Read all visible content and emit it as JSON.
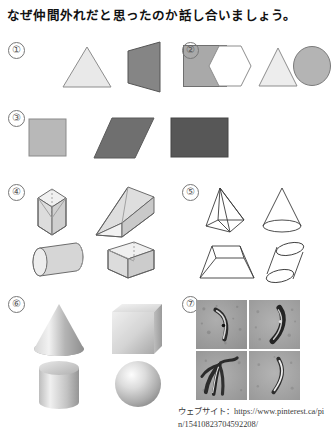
{
  "worksheet": {
    "title": "なぜ仲間外れだと思ったのか話し合いましょう。",
    "source_label": "ウェブサイト：https://www.pinterest.ca/pin/15410823704592208/"
  },
  "groups": [
    {
      "id": "group-1",
      "marker": "①",
      "style": "flat-filled-2d",
      "shapes": [
        {
          "name": "triangle",
          "fill": "#e9e9e9",
          "stroke": "#8d8d8d"
        },
        {
          "name": "perspective-quadrilateral",
          "fill": "#858585",
          "stroke": "#555555"
        },
        {
          "name": "square",
          "fill": "#a9a9a9",
          "stroke": "#6f6f6f"
        }
      ]
    },
    {
      "id": "group-2",
      "marker": "②",
      "style": "flat-outline-2d",
      "shapes": [
        {
          "name": "hexagon",
          "fill": "#ffffff",
          "stroke": "#8d8d8d"
        },
        {
          "name": "triangle",
          "fill": "#ededed",
          "stroke": "#8d8d8d"
        },
        {
          "name": "circle",
          "fill": "#b4b4b4",
          "stroke": "#7a7a7a"
        }
      ]
    },
    {
      "id": "group-3",
      "marker": "③",
      "style": "flat-filled-2d",
      "shapes": [
        {
          "name": "square",
          "fill": "#b8b8b8",
          "stroke": "#8a8a8a"
        },
        {
          "name": "parallelogram",
          "fill": "#6f6f6f",
          "stroke": "#5a5a5a"
        },
        {
          "name": "rectangle",
          "fill": "#575757",
          "stroke": "#464646"
        }
      ]
    },
    {
      "id": "group-4",
      "marker": "④",
      "style": "transparent-wireframe-3d",
      "shapes": [
        {
          "name": "cube",
          "fill": "#e8e8e8",
          "stroke": "#5e5e5e"
        },
        {
          "name": "triangular-prism",
          "fill": "#e8e8e8",
          "stroke": "#5e5e5e"
        },
        {
          "name": "cylinder",
          "fill": "#dedede",
          "stroke": "#5e5e5e"
        },
        {
          "name": "rectangular-box",
          "fill": "#e8e8e8",
          "stroke": "#5e5e5e"
        }
      ]
    },
    {
      "id": "group-5",
      "marker": "⑤",
      "style": "line-art-3d",
      "shapes": [
        {
          "name": "square-pyramid",
          "fill": "none",
          "stroke": "#3b3b3b"
        },
        {
          "name": "cone",
          "fill": "none",
          "stroke": "#3b3b3b"
        },
        {
          "name": "truncated-pyramid-frustum",
          "fill": "none",
          "stroke": "#3b3b3b"
        },
        {
          "name": "oblique-cylinder",
          "fill": "none",
          "stroke": "#3b3b3b"
        }
      ]
    },
    {
      "id": "group-6",
      "marker": "⑥",
      "style": "shaded-solid-3d",
      "shapes": [
        {
          "name": "cone",
          "fill": "#c6c6c6",
          "stroke": "none"
        },
        {
          "name": "cube",
          "fill": "#d2d2d2",
          "stroke": "none"
        },
        {
          "name": "cylinder",
          "fill": "#c9c9c9",
          "stroke": "none"
        },
        {
          "name": "sphere",
          "fill": "#cccccc",
          "stroke": "none"
        }
      ]
    },
    {
      "id": "group-7",
      "marker": "⑦",
      "style": "microscopy-photo-grid",
      "panels": [
        {
          "name": "photo-top-left",
          "subject": "curved-crescent-organism"
        },
        {
          "name": "photo-top-right",
          "subject": "curved-crescent-organism"
        },
        {
          "name": "photo-bottom-left",
          "subject": "splayed-organism-cluster"
        },
        {
          "name": "photo-bottom-right",
          "subject": "curved-crescent-organism"
        }
      ]
    }
  ]
}
